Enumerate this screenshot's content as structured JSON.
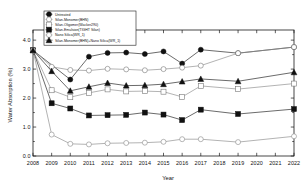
{
  "chart_data": {
    "type": "line",
    "title": "",
    "xlabel": "Year",
    "ylabel": "Water Absorption (%)",
    "x": [
      2008,
      2009,
      2010,
      2011,
      2012,
      2013,
      2014,
      2015,
      2016,
      2017,
      2019,
      2022
    ],
    "xticks": [
      "2008",
      "2009",
      "2010",
      "2011",
      "2012",
      "2013",
      "2014",
      "2015",
      "2016",
      "2017",
      "2018",
      "2019",
      "2020",
      "2021",
      "2022"
    ],
    "yticks": [
      "0.0",
      "1.0",
      "2.0",
      "3.0",
      "4.0"
    ],
    "xlim": [
      2008,
      2022
    ],
    "ylim": [
      0.0,
      4.35
    ],
    "grid": false,
    "legend_position": "top-left",
    "series": [
      {
        "name": "Untreated",
        "marker": "filled-circle",
        "color": "#1a1a1a",
        "x": [
          2008,
          2010,
          2011,
          2012,
          2013,
          2014,
          2015,
          2016,
          2017,
          2019,
          2022
        ],
        "values": [
          3.65,
          2.64,
          3.43,
          3.56,
          3.57,
          3.52,
          3.61,
          3.19,
          3.67,
          3.55,
          3.76
        ]
      },
      {
        "name": "Silan-Monomer(BHN)",
        "marker": "open-circle",
        "color": "#8a8a8a",
        "x": [
          2008,
          2009,
          2010,
          2011,
          2012,
          2013,
          2014,
          2015,
          2016,
          2017,
          2019,
          2022
        ],
        "values": [
          3.65,
          3.08,
          2.97,
          2.95,
          3.01,
          2.99,
          2.96,
          3.0,
          3.05,
          3.12,
          3.55,
          3.76
        ]
      },
      {
        "name": "Silan-Oligomer(Wacker290)",
        "marker": "open-triangle",
        "color": "#8a8a8a",
        "x": [
          2008,
          2009,
          2010,
          2011,
          2012,
          2013,
          2014,
          2015,
          2016,
          2017,
          2019,
          2022
        ],
        "values": [
          3.65,
          2.27,
          2.03,
          2.18,
          2.3,
          2.23,
          2.24,
          2.22,
          2.04,
          2.42,
          2.31,
          2.5
        ]
      },
      {
        "name": "Silan-Emulsion(TIGHT Silan)",
        "marker": "filled-circle-2",
        "color": "#1a1a1a",
        "x": [
          2008,
          2009,
          2010,
          2011,
          2012,
          2013,
          2014,
          2015,
          2016,
          2017,
          2019,
          2022
        ],
        "values": [
          3.65,
          1.82,
          1.64,
          1.4,
          1.41,
          1.42,
          1.5,
          1.43,
          1.24,
          1.6,
          1.45,
          1.62
        ]
      },
      {
        "name": "Nano Silica(WR_1)",
        "marker": "open-circle-2",
        "color": "#8a8a8a",
        "x": [
          2008,
          2009,
          2010,
          2011,
          2012,
          2013,
          2014,
          2015,
          2016,
          2017,
          2019,
          2022
        ],
        "values": [
          3.65,
          0.74,
          0.42,
          0.4,
          0.44,
          0.45,
          0.46,
          0.49,
          0.58,
          0.58,
          0.48,
          0.68
        ]
      },
      {
        "name": "Silan-Monomer(BHN)+Nano Silica(WR_1)",
        "marker": "filled-triangle",
        "color": "#1a1a1a",
        "x": [
          2008,
          2009,
          2010,
          2011,
          2012,
          2013,
          2014,
          2015,
          2016,
          2017,
          2019,
          2022
        ],
        "values": [
          3.65,
          2.93,
          2.25,
          2.39,
          2.52,
          2.43,
          2.44,
          2.48,
          2.57,
          2.66,
          2.58,
          2.89
        ]
      }
    ]
  }
}
